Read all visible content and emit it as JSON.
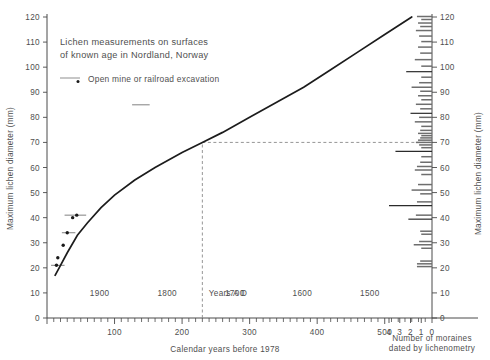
{
  "title": {
    "line1": "Lichen measurements on surfaces",
    "line2": "of known age in Nordland, Norway"
  },
  "legend": {
    "items": [
      {
        "label": "Open mine or railroad excavation",
        "symbol": "line-with-dot"
      }
    ]
  },
  "axes": {
    "left": {
      "title": "Maximum lichen diameter (mm)",
      "ticks": [
        "0",
        "10",
        "20",
        "30",
        "40",
        "50",
        "60",
        "70",
        "80",
        "90",
        "100",
        "110",
        "120"
      ]
    },
    "right": {
      "title": "Maximum lichen diameter (mm)",
      "ticks": [
        "0",
        "10",
        "20",
        "30",
        "40",
        "50",
        "60",
        "70",
        "80",
        "90",
        "100",
        "110",
        "120"
      ]
    },
    "bottom_primary": {
      "title": "Calendar years before 1978",
      "ticks": [
        "100",
        "200",
        "300",
        "400",
        "500"
      ]
    },
    "bottom_secondary": {
      "title": "Years A D",
      "ticks": [
        "1900",
        "1800",
        "1700",
        "1600",
        "1500"
      ]
    },
    "bottom_right": {
      "title_line1": "Number of moraines",
      "title_line2": "dated by lichenometry",
      "ticks": [
        "4",
        "3",
        "2",
        "1",
        "0"
      ]
    }
  },
  "colors": {
    "curve": "#1c1c1c",
    "axis": "#4a4a4a",
    "text": "#4f4f4f",
    "errorbar": "#8c8c8c",
    "histogram": "#6e6e6e",
    "guide": "#8a8a8a",
    "background": "#ffffff"
  },
  "chart_data": {
    "type": "line",
    "title": "Lichen measurements on surfaces of known age in Nordland, Norway",
    "xlabel": "Calendar years before 1978",
    "ylabel": "Maximum lichen diameter (mm)",
    "xlim": [
      0,
      570
    ],
    "ylim": [
      0,
      120
    ],
    "grid": false,
    "legend_position": "top-left",
    "series": [
      {
        "name": "Lichen growth curve",
        "type": "line",
        "x": [
          12,
          20,
          30,
          45,
          60,
          80,
          100,
          130,
          160,
          200,
          230,
          260,
          300,
          340,
          380,
          420,
          460,
          500,
          540
        ],
        "y": [
          17,
          21,
          26,
          33,
          38,
          44,
          49,
          55,
          60,
          66,
          70,
          74,
          80,
          86,
          92,
          99,
          106,
          113,
          120
        ]
      },
      {
        "name": "Open mine or railroad excavation",
        "type": "scatter",
        "x": [
          14,
          16,
          24,
          30,
          38,
          44
        ],
        "y": [
          21,
          24,
          29,
          34,
          40,
          41
        ],
        "error_bars_x": [
          {
            "x": 14,
            "y": 21,
            "xlow": 6,
            "xhigh": 26
          },
          {
            "x": 30,
            "y": 34,
            "xlow": 22,
            "xhigh": 42
          },
          {
            "x": 44,
            "y": 41,
            "xlow": 26,
            "xhigh": 58
          },
          {
            "x": 140,
            "y": 85,
            "xlow": 126,
            "xhigh": 152
          }
        ]
      }
    ],
    "annotations": [
      {
        "type": "dashed-vline",
        "x": 230,
        "from_y": 0,
        "to_y": 70
      },
      {
        "type": "dashed-hline",
        "y": 70,
        "from_x": 230,
        "to_x": 570
      }
    ],
    "histogram": {
      "type": "bar",
      "orientation": "horizontal",
      "xlabel": "Number of moraines dated by lichenometry",
      "ylabel": "Maximum lichen diameter (mm)",
      "xlim": [
        0,
        4
      ],
      "bins": [
        {
          "y": 20.5,
          "count": 1.4
        },
        {
          "y": 21.6,
          "count": 1.4
        },
        {
          "y": 22.7,
          "count": 1.1
        },
        {
          "y": 27.8,
          "count": 1.0
        },
        {
          "y": 29.2,
          "count": 1.7
        },
        {
          "y": 30.5,
          "count": 1.2
        },
        {
          "y": 33.4,
          "count": 1.0
        },
        {
          "y": 34.6,
          "count": 1.1
        },
        {
          "y": 39.4,
          "count": 2.2
        },
        {
          "y": 41.0,
          "count": 1.5
        },
        {
          "y": 44.8,
          "count": 4.0
        },
        {
          "y": 46.3,
          "count": 1.4
        },
        {
          "y": 49.5,
          "count": 1.1
        },
        {
          "y": 51.0,
          "count": 1.9
        },
        {
          "y": 53.2,
          "count": 1.3
        },
        {
          "y": 57.2,
          "count": 1.0
        },
        {
          "y": 59.0,
          "count": 1.6
        },
        {
          "y": 60.4,
          "count": 1.4
        },
        {
          "y": 62.1,
          "count": 1.1
        },
        {
          "y": 64.3,
          "count": 1.0
        },
        {
          "y": 66.4,
          "count": 3.4
        },
        {
          "y": 67.9,
          "count": 1.0
        },
        {
          "y": 69.0,
          "count": 1.2
        },
        {
          "y": 70.0,
          "count": 1.5
        },
        {
          "y": 70.9,
          "count": 1.3
        },
        {
          "y": 71.8,
          "count": 1.1
        },
        {
          "y": 72.7,
          "count": 1.0
        },
        {
          "y": 73.6,
          "count": 1.3
        },
        {
          "y": 74.8,
          "count": 1.1
        },
        {
          "y": 76.4,
          "count": 1.0
        },
        {
          "y": 78.2,
          "count": 1.6
        },
        {
          "y": 80.0,
          "count": 1.2
        },
        {
          "y": 81.6,
          "count": 2.0
        },
        {
          "y": 83.4,
          "count": 1.1
        },
        {
          "y": 85.2,
          "count": 1.5
        },
        {
          "y": 87.0,
          "count": 1.0
        },
        {
          "y": 88.6,
          "count": 1.3
        },
        {
          "y": 90.4,
          "count": 1.1
        },
        {
          "y": 92.0,
          "count": 1.9
        },
        {
          "y": 93.8,
          "count": 1.2
        },
        {
          "y": 96.0,
          "count": 1.0
        },
        {
          "y": 98.2,
          "count": 2.4
        },
        {
          "y": 100.4,
          "count": 1.0
        },
        {
          "y": 103.0,
          "count": 1.6
        },
        {
          "y": 105.6,
          "count": 1.1
        },
        {
          "y": 108.0,
          "count": 1.3
        },
        {
          "y": 110.2,
          "count": 1.0
        },
        {
          "y": 112.4,
          "count": 1.2
        },
        {
          "y": 114.6,
          "count": 1.5
        },
        {
          "y": 116.2,
          "count": 1.1
        },
        {
          "y": 117.6,
          "count": 1.3
        },
        {
          "y": 119.0,
          "count": 1.0
        },
        {
          "y": 120.2,
          "count": 1.4
        }
      ]
    }
  }
}
